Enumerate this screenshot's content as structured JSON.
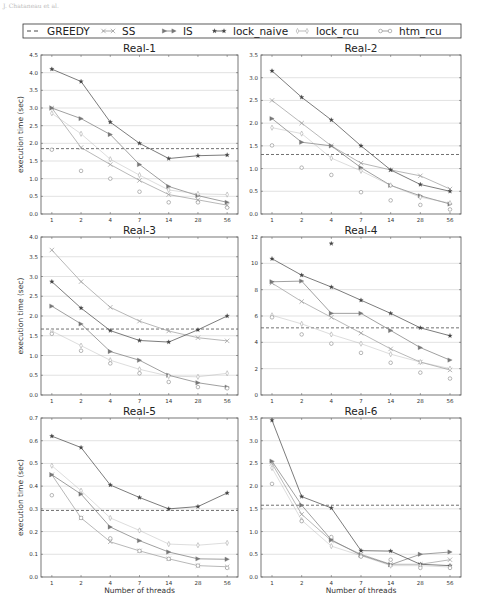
{
  "page_header": "J. Chataneau et al.",
  "legend": {
    "items": [
      {
        "key": "greedy",
        "label": "GREEDY",
        "color": "#333333",
        "marker": "none",
        "dash": "4,3"
      },
      {
        "key": "ss",
        "label": "SS",
        "color": "#999999",
        "marker": "x"
      },
      {
        "key": "is",
        "label": "IS",
        "color": "#777777",
        "marker": "triangle-right"
      },
      {
        "key": "lock_naive",
        "label": "lock_naive",
        "color": "#444444",
        "marker": "star"
      },
      {
        "key": "lock_rcu",
        "label": "lock_rcu",
        "color": "#aaaaaa",
        "marker": "thin-diamond"
      },
      {
        "key": "htm_rcu",
        "label": "htm_rcu",
        "color": "#888888",
        "marker": "circle"
      }
    ]
  },
  "chart_data": [
    {
      "type": "line",
      "title": "Real-1",
      "xlabel": "",
      "ylabel": "execution time (sec)",
      "categories": [
        "1",
        "2",
        "4",
        "7",
        "14",
        "28",
        "56"
      ],
      "ylim": [
        0,
        4.5
      ],
      "yticks": [
        0.0,
        0.5,
        1.0,
        1.5,
        2.0,
        2.5,
        3.0,
        3.5,
        4.0,
        4.5
      ],
      "ytick_labels": [
        "0.0",
        "0.5",
        "1.0",
        "1.5",
        "2.0",
        "2.5",
        "3.0",
        "3.5",
        "4.0",
        "4.5"
      ],
      "grid": true,
      "greedy": 1.85,
      "series": [
        {
          "name": "SS",
          "values": [
            3.0,
            1.88,
            1.4,
            0.95,
            0.55,
            0.4,
            0.25
          ]
        },
        {
          "name": "IS",
          "values": [
            3.0,
            2.7,
            2.25,
            1.4,
            0.78,
            0.52,
            0.33
          ]
        },
        {
          "name": "lock_naive",
          "values": [
            4.1,
            3.75,
            2.6,
            2.0,
            1.57,
            1.65,
            1.67
          ]
        },
        {
          "name": "lock_rcu",
          "values": [
            2.85,
            2.27,
            1.55,
            1.1,
            0.68,
            0.57,
            0.55
          ]
        },
        {
          "name": "htm_rcu",
          "values": [
            1.82,
            1.22,
            1.0,
            0.63,
            0.33,
            0.33,
            0.18
          ]
        }
      ]
    },
    {
      "type": "line",
      "title": "Real-2",
      "xlabel": "",
      "ylabel": "",
      "categories": [
        "1",
        "2",
        "4",
        "7",
        "14",
        "28",
        "56"
      ],
      "ylim": [
        0,
        3.5
      ],
      "yticks": [
        0.0,
        0.5,
        1.0,
        1.5,
        2.0,
        2.5,
        3.0,
        3.5
      ],
      "ytick_labels": [
        "0.0",
        "0.5",
        "1.0",
        "1.5",
        "2.0",
        "2.5",
        "3.0",
        "3.5"
      ],
      "grid": true,
      "greedy": 1.31,
      "series": [
        {
          "name": "SS",
          "values": [
            2.5,
            2.0,
            1.5,
            1.12,
            0.97,
            0.84,
            0.55
          ]
        },
        {
          "name": "IS",
          "values": [
            2.1,
            1.58,
            1.5,
            1.02,
            0.63,
            0.4,
            0.22
          ]
        },
        {
          "name": "lock_naive",
          "values": [
            3.15,
            2.57,
            2.07,
            1.5,
            0.97,
            0.65,
            0.5
          ]
        },
        {
          "name": "lock_rcu",
          "values": [
            1.9,
            1.77,
            1.23,
            0.95,
            0.63,
            0.37,
            0.24
          ]
        },
        {
          "name": "htm_rcu",
          "values": [
            1.51,
            1.02,
            0.86,
            0.48,
            0.3,
            0.2,
            0.1
          ]
        }
      ]
    },
    {
      "type": "line",
      "title": "Real-3",
      "xlabel": "",
      "ylabel": "execution time (sec)",
      "categories": [
        "1",
        "2",
        "4",
        "7",
        "14",
        "28",
        "56"
      ],
      "ylim": [
        0,
        4.0
      ],
      "yticks": [
        0.0,
        0.5,
        1.0,
        1.5,
        2.0,
        2.5,
        3.0,
        3.5,
        4.0
      ],
      "ytick_labels": [
        "0.0",
        "0.5",
        "1.0",
        "1.5",
        "2.0",
        "2.5",
        "3.0",
        "3.5",
        "4.0"
      ],
      "grid": true,
      "greedy": 1.67,
      "series": [
        {
          "name": "SS",
          "values": [
            3.67,
            2.87,
            2.22,
            1.87,
            1.62,
            1.45,
            1.37
          ]
        },
        {
          "name": "IS",
          "values": [
            2.25,
            1.8,
            1.1,
            0.88,
            0.5,
            0.31,
            0.2
          ]
        },
        {
          "name": "lock_naive",
          "values": [
            2.87,
            2.2,
            1.63,
            1.38,
            1.34,
            1.65,
            2.0
          ]
        },
        {
          "name": "lock_rcu",
          "values": [
            1.62,
            1.25,
            0.88,
            0.65,
            0.48,
            0.46,
            0.55
          ]
        },
        {
          "name": "htm_rcu",
          "values": [
            1.55,
            1.12,
            0.8,
            0.55,
            0.33,
            0.2,
            0.17
          ]
        }
      ]
    },
    {
      "type": "line",
      "title": "Real-4",
      "xlabel": "",
      "ylabel": "",
      "categories": [
        "1",
        "2",
        "4",
        "7",
        "14",
        "28",
        "56"
      ],
      "ylim": [
        0,
        12
      ],
      "yticks": [
        0,
        2,
        4,
        6,
        8,
        10,
        12
      ],
      "ytick_labels": [
        "0",
        "2",
        "4",
        "6",
        "8",
        "10",
        "12"
      ],
      "grid": true,
      "greedy": 5.1,
      "series": [
        {
          "name": "SS",
          "values": [
            8.5,
            7.1,
            5.9,
            4.7,
            3.5,
            2.5,
            1.9
          ]
        },
        {
          "name": "IS",
          "values": [
            8.6,
            8.65,
            6.2,
            6.2,
            4.9,
            3.6,
            2.65
          ]
        },
        {
          "name": "lock_naive",
          "values": [
            10.35,
            9.1,
            8.2,
            7.2,
            6.2,
            5.1,
            4.5,
            11.5
          ]
        },
        {
          "name": "lock_rcu",
          "values": [
            6.05,
            5.4,
            4.6,
            3.9,
            3.1,
            2.5,
            2.0
          ]
        },
        {
          "name": "htm_rcu",
          "values": [
            5.9,
            4.6,
            3.9,
            3.2,
            2.45,
            1.7,
            1.25
          ]
        }
      ],
      "annotations": [
        {
          "series": "lock_naive",
          "category": "4",
          "value": 11.5,
          "note": "isolated marker"
        }
      ]
    },
    {
      "type": "line",
      "title": "Real-5",
      "xlabel": "Number of threads",
      "ylabel": "execution time (sec)",
      "categories": [
        "1",
        "2",
        "4",
        "7",
        "14",
        "28",
        "56"
      ],
      "ylim": [
        0,
        0.7
      ],
      "yticks": [
        0.0,
        0.1,
        0.2,
        0.3,
        0.4,
        0.5,
        0.6,
        0.7
      ],
      "ytick_labels": [
        "0.0",
        "0.1",
        "0.2",
        "0.3",
        "0.4",
        "0.5",
        "0.6",
        "0.7"
      ],
      "grid": true,
      "greedy": 0.293,
      "series": [
        {
          "name": "SS",
          "values": [
            0.45,
            0.26,
            0.155,
            0.115,
            0.08,
            0.05,
            0.045
          ]
        },
        {
          "name": "IS",
          "values": [
            0.45,
            0.365,
            0.22,
            0.16,
            0.11,
            0.08,
            0.078
          ]
        },
        {
          "name": "lock_naive",
          "values": [
            0.62,
            0.57,
            0.405,
            0.35,
            0.3,
            0.31,
            0.37
          ]
        },
        {
          "name": "lock_rcu",
          "values": [
            0.49,
            0.38,
            0.26,
            0.205,
            0.145,
            0.14,
            0.15
          ]
        },
        {
          "name": "htm_rcu",
          "values": [
            0.36,
            0.26,
            0.17,
            0.115,
            0.08,
            0.05,
            0.04
          ]
        }
      ]
    },
    {
      "type": "line",
      "title": "Real-6",
      "xlabel": "Number of threads",
      "ylabel": "",
      "categories": [
        "1",
        "2",
        "4",
        "7",
        "14",
        "28",
        "56"
      ],
      "ylim": [
        0,
        3.5
      ],
      "yticks": [
        0.0,
        0.5,
        1.0,
        1.5,
        2.0,
        2.5,
        3.0,
        3.5
      ],
      "ytick_labels": [
        "0.0",
        "0.5",
        "1.0",
        "1.5",
        "2.0",
        "2.5",
        "3.0",
        "3.5"
      ],
      "grid": true,
      "greedy": 1.58,
      "series": [
        {
          "name": "SS",
          "values": [
            2.5,
            1.38,
            0.8,
            0.5,
            0.28,
            0.28,
            0.38
          ]
        },
        {
          "name": "IS",
          "values": [
            2.55,
            1.58,
            0.82,
            0.48,
            0.27,
            0.5,
            0.55
          ]
        },
        {
          "name": "lock_naive",
          "values": [
            3.45,
            1.77,
            1.52,
            0.58,
            0.57,
            0.28,
            0.25
          ]
        },
        {
          "name": "lock_rcu",
          "values": [
            2.4,
            1.25,
            0.68,
            0.47,
            0.25,
            0.25,
            0.22
          ]
        },
        {
          "name": "htm_rcu",
          "values": [
            2.05,
            1.23,
            0.88,
            0.45,
            0.38,
            0.2,
            0.2
          ]
        }
      ]
    }
  ]
}
